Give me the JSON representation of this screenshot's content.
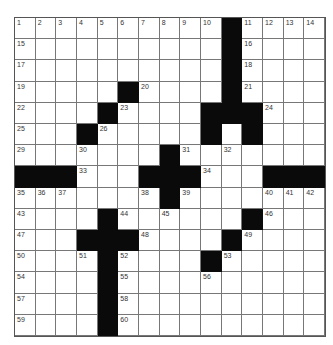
{
  "puzzle": {
    "rows": 15,
    "cols": 15,
    "grid": [
      "..........#....",
      "..........#....",
      "..........#....",
      ".....#....#....",
      "....#....###...",
      "...#.....#.#...",
      ".......#.......",
      "###...###...###",
      ".......#.......",
      "....#......#...",
      "...###....#....",
      "....#....#.....",
      "....#..........",
      "....#..........",
      "....#.........."
    ],
    "numbers": [
      {
        "r": 0,
        "c": 0,
        "n": "1"
      },
      {
        "r": 0,
        "c": 1,
        "n": "2"
      },
      {
        "r": 0,
        "c": 2,
        "n": "3"
      },
      {
        "r": 0,
        "c": 3,
        "n": "4"
      },
      {
        "r": 0,
        "c": 4,
        "n": "5"
      },
      {
        "r": 0,
        "c": 5,
        "n": "6"
      },
      {
        "r": 0,
        "c": 6,
        "n": "7"
      },
      {
        "r": 0,
        "c": 7,
        "n": "8"
      },
      {
        "r": 0,
        "c": 8,
        "n": "9"
      },
      {
        "r": 0,
        "c": 9,
        "n": "10"
      },
      {
        "r": 0,
        "c": 11,
        "n": "11"
      },
      {
        "r": 0,
        "c": 12,
        "n": "12"
      },
      {
        "r": 0,
        "c": 13,
        "n": "13"
      },
      {
        "r": 0,
        "c": 14,
        "n": "14"
      },
      {
        "r": 1,
        "c": 0,
        "n": "15"
      },
      {
        "r": 1,
        "c": 11,
        "n": "16"
      },
      {
        "r": 2,
        "c": 0,
        "n": "17"
      },
      {
        "r": 2,
        "c": 11,
        "n": "18"
      },
      {
        "r": 3,
        "c": 0,
        "n": "19"
      },
      {
        "r": 3,
        "c": 6,
        "n": "20"
      },
      {
        "r": 3,
        "c": 11,
        "n": "21"
      },
      {
        "r": 4,
        "c": 0,
        "n": "22"
      },
      {
        "r": 4,
        "c": 5,
        "n": "23"
      },
      {
        "r": 4,
        "c": 12,
        "n": "24"
      },
      {
        "r": 5,
        "c": 0,
        "n": "25"
      },
      {
        "r": 5,
        "c": 4,
        "n": "26"
      },
      {
        "r": 5,
        "c": 9,
        "n": "27"
      },
      {
        "r": 5,
        "c": 11,
        "n": "28"
      },
      {
        "r": 6,
        "c": 0,
        "n": "29"
      },
      {
        "r": 6,
        "c": 3,
        "n": "30"
      },
      {
        "r": 6,
        "c": 8,
        "n": "31"
      },
      {
        "r": 6,
        "c": 10,
        "n": "32"
      },
      {
        "r": 7,
        "c": 3,
        "n": "33"
      },
      {
        "r": 7,
        "c": 9,
        "n": "34"
      },
      {
        "r": 8,
        "c": 0,
        "n": "35"
      },
      {
        "r": 8,
        "c": 1,
        "n": "36"
      },
      {
        "r": 8,
        "c": 2,
        "n": "37"
      },
      {
        "r": 8,
        "c": 6,
        "n": "38"
      },
      {
        "r": 8,
        "c": 8,
        "n": "39"
      },
      {
        "r": 8,
        "c": 12,
        "n": "40"
      },
      {
        "r": 8,
        "c": 13,
        "n": "41"
      },
      {
        "r": 8,
        "c": 14,
        "n": "42"
      },
      {
        "r": 9,
        "c": 0,
        "n": "43"
      },
      {
        "r": 9,
        "c": 5,
        "n": "44"
      },
      {
        "r": 9,
        "c": 7,
        "n": "45"
      },
      {
        "r": 9,
        "c": 12,
        "n": "46"
      },
      {
        "r": 10,
        "c": 0,
        "n": "47"
      },
      {
        "r": 10,
        "c": 6,
        "n": "48"
      },
      {
        "r": 10,
        "c": 11,
        "n": "49"
      },
      {
        "r": 11,
        "c": 0,
        "n": "50"
      },
      {
        "r": 11,
        "c": 3,
        "n": "51"
      },
      {
        "r": 11,
        "c": 5,
        "n": "52"
      },
      {
        "r": 11,
        "c": 10,
        "n": "53"
      },
      {
        "r": 12,
        "c": 0,
        "n": "54"
      },
      {
        "r": 12,
        "c": 5,
        "n": "55"
      },
      {
        "r": 12,
        "c": 9,
        "n": "56"
      },
      {
        "r": 13,
        "c": 0,
        "n": "57"
      },
      {
        "r": 13,
        "c": 5,
        "n": "58"
      },
      {
        "r": 14,
        "c": 0,
        "n": "59"
      },
      {
        "r": 14,
        "c": 5,
        "n": "60"
      }
    ]
  }
}
